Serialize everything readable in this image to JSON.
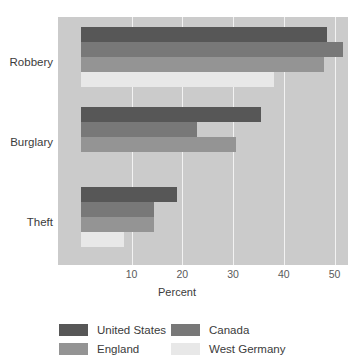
{
  "chart_data": {
    "type": "bar",
    "orientation": "horizontal",
    "title": "",
    "xlabel": "Percent",
    "ylabel": "",
    "categories": [
      "Robbery",
      "Burglary",
      "Theft"
    ],
    "series": [
      {
        "name": "United States",
        "color": "#575757",
        "values": [
          48.5,
          35.5,
          19.0
        ]
      },
      {
        "name": "Canada",
        "color": "#787878",
        "values": [
          51.7,
          22.8,
          14.5
        ]
      },
      {
        "name": "England",
        "color": "#949494",
        "values": [
          48.0,
          30.5,
          14.4
        ]
      },
      {
        "name": "West Germany",
        "color": "#e8e8e8",
        "values": [
          38.0,
          0.0,
          8.5
        ]
      }
    ],
    "xticks": [
      10,
      20,
      30,
      40,
      50
    ],
    "xlim": [
      0,
      58
    ],
    "grid": true,
    "grid_color": "#f2f2f2",
    "plot_background": "#cbcbcb",
    "legend_position": "bottom",
    "legend": [
      {
        "label": "United States",
        "color": "#575757"
      },
      {
        "label": "Canada",
        "color": "#787878"
      },
      {
        "label": "England",
        "color": "#949494"
      },
      {
        "label": "West Germany",
        "color": "#e8e8e8"
      }
    ]
  }
}
